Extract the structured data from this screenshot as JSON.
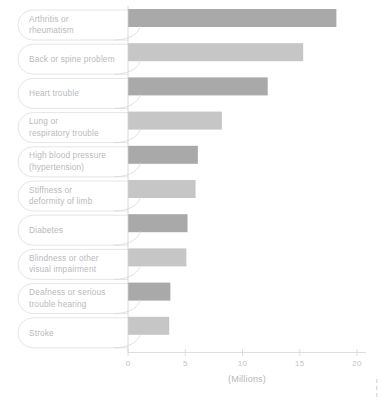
{
  "chart_data": {
    "type": "bar",
    "orientation": "horizontal",
    "title": "",
    "subtitle": "",
    "xlabel": "(Millions)",
    "ylabel": "",
    "xlim": [
      0,
      21.2
    ],
    "xticks": [
      0,
      5,
      10,
      15,
      20
    ],
    "xtick_labels": [
      "0",
      "5",
      "10",
      "15",
      "20"
    ],
    "grid": false,
    "legend": "none",
    "categories": [
      "Arthritis or rheumatism",
      "Back or spine problem",
      "Heart trouble",
      "Lung or respiratory trouble",
      "High blood pressure (hypertension)",
      "Stiffness or deformity of limb",
      "Diabetes",
      "Blindness or other visual impairment",
      "Deafness or serious trouble hearing",
      "Stroke"
    ],
    "category_lines": [
      [
        "Arthritis or",
        "rheumatism"
      ],
      [
        "Back or spine problem"
      ],
      [
        "Heart trouble"
      ],
      [
        "Lung or",
        "respiratory trouble"
      ],
      [
        "High blood pressure",
        "(hypertension)"
      ],
      [
        "Stiffness or",
        "deformity of limb"
      ],
      [
        "Diabetes"
      ],
      [
        "Blindness or other",
        "visual impairment"
      ],
      [
        "Deafness or serious",
        "trouble hearing"
      ],
      [
        "Stroke"
      ]
    ],
    "values": [
      18.2,
      15.3,
      12.2,
      8.2,
      6.1,
      5.9,
      5.2,
      5.1,
      3.7,
      3.6
    ],
    "bar_colors": [
      "#a9a9a9",
      "#c6c6c6",
      "#a9a9a9",
      "#c6c6c6",
      "#a9a9a9",
      "#c6c6c6",
      "#a9a9a9",
      "#c6c6c6",
      "#a9a9a9",
      "#c6c6c6"
    ]
  },
  "colors": {
    "bar_dark": "#a9a9a9",
    "bar_light": "#c6c6c6",
    "outline": "#dededf",
    "axis": "#d5d5d7",
    "label_text": "#b9b9bd",
    "tick_text": "#c2c2c6",
    "background": "#ffffff"
  },
  "axis": {
    "x_title": "(Millions)",
    "ticks": [
      "0",
      "5",
      "10",
      "15",
      "20"
    ]
  }
}
